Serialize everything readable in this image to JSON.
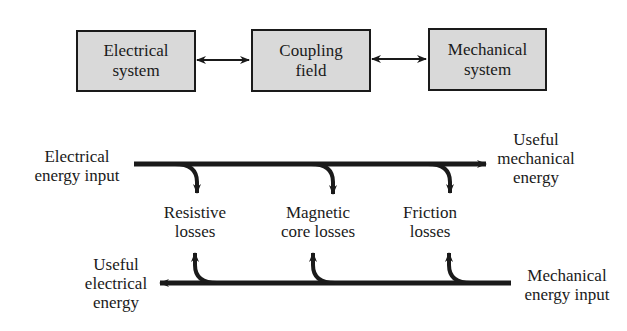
{
  "blocks": [
    {
      "id": "electrical",
      "lines": [
        "Electrical",
        "system"
      ]
    },
    {
      "id": "coupling",
      "lines": [
        "Coupling",
        "field"
      ]
    },
    {
      "id": "mechanical",
      "lines": [
        "Mechanical",
        "system"
      ]
    }
  ],
  "top_flow": {
    "input_label": [
      "Electrical",
      "energy input"
    ],
    "output_label": [
      "Useful",
      "mechanical",
      "energy"
    ]
  },
  "losses": [
    {
      "id": "resistive",
      "lines": [
        "Resistive",
        "losses"
      ]
    },
    {
      "id": "magnetic",
      "lines": [
        "Magnetic",
        "core losses"
      ]
    },
    {
      "id": "friction",
      "lines": [
        "Friction",
        "losses"
      ]
    }
  ],
  "bottom_flow": {
    "input_label": [
      "Mechanical",
      "energy input"
    ],
    "output_label": [
      "Useful",
      "electrical",
      "energy"
    ]
  },
  "colors": {
    "box_fill": "#d9d9d9",
    "stroke": "#1a1a1a"
  }
}
